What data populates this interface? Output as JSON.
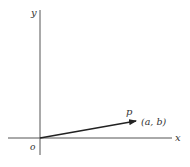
{
  "diagram": {
    "type": "vector-in-plane",
    "axes": {
      "x_label": "x",
      "y_label": "y",
      "origin_label": "o"
    },
    "vector": {
      "label": "p",
      "endpoint_label": "(a, b)",
      "from": "origin",
      "to": "(a, b)"
    },
    "colors": {
      "axis": "#555555",
      "vector": "#222222",
      "text": "#333333",
      "background": "#ffffff"
    }
  }
}
